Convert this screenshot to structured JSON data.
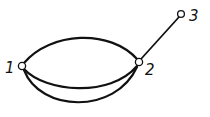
{
  "diagram": {
    "type": "multigraph",
    "nodes": [
      {
        "id": "1",
        "label": "1"
      },
      {
        "id": "2",
        "label": "2"
      },
      {
        "id": "3",
        "label": "3"
      }
    ],
    "edges": [
      {
        "from": "1",
        "to": "2",
        "shape": "upper-arc"
      },
      {
        "from": "1",
        "to": "2",
        "shape": "lower-arc-inner"
      },
      {
        "from": "1",
        "to": "2",
        "shape": "lower-arc-outer"
      },
      {
        "from": "2",
        "to": "3",
        "shape": "straight"
      }
    ],
    "colors": {
      "stroke": "#111111",
      "node_fill": "#ffffff",
      "background": "#ffffff"
    }
  }
}
